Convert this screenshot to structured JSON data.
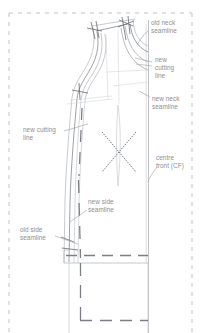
{
  "document": {
    "kind": "pattern-drafting-diagram",
    "subject": "bodice front pattern alteration",
    "background_color": "#ffffff",
    "frame": {
      "name": "paper-frame",
      "style": "dashed",
      "color": "#b9bcc0"
    }
  },
  "palette": {
    "annotation_text": "#8d8f93",
    "outline_dark": "#6f7378",
    "outline_light": "#b6b9bd",
    "construction": "#c9ccd0",
    "dash_mark": "#7c8086",
    "leader_line": "#a9acb1"
  },
  "annotations": [
    {
      "id": "old-neck-seamline",
      "text": "old neck\nseamline",
      "x": 151,
      "y": 19,
      "align": "left"
    },
    {
      "id": "new-cutting-line-right",
      "text": "new\ncutting\nline",
      "x": 155,
      "y": 56,
      "align": "left"
    },
    {
      "id": "new-neck-seamline",
      "text": "new neck\nseamline",
      "x": 152,
      "y": 95,
      "align": "left"
    },
    {
      "id": "new-cutting-line-left",
      "text": "new cutting\nline",
      "x": 23,
      "y": 126,
      "align": "left"
    },
    {
      "id": "centre-front-cf",
      "text": "centre\nfront (CF)",
      "x": 156,
      "y": 154,
      "align": "left"
    },
    {
      "id": "new-side-seamline",
      "text": "new side\nseamline",
      "x": 88,
      "y": 198,
      "align": "left"
    },
    {
      "id": "old-side-seamline",
      "text": "old side\nseamline",
      "x": 20,
      "y": 226,
      "align": "left"
    }
  ],
  "shapes": {
    "frame_rect": {
      "x": 8,
      "y": 12,
      "width": 185,
      "height": 321
    },
    "centre_front_line": {
      "x": 148,
      "y_top": 18,
      "y_bottom": 333
    },
    "hem_line_y": 263,
    "lower_dash_y": 320
  }
}
